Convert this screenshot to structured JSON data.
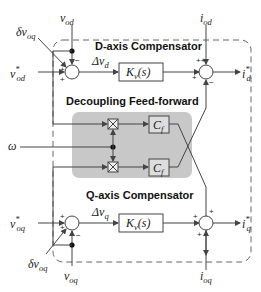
{
  "diagram": {
    "d_axis": {
      "title": "D-axis Compensator",
      "block": "K",
      "block_sub": "v",
      "block_arg": "(s)",
      "error": "Δv",
      "error_sub": "d",
      "ref_input": "v",
      "ref_input_sub": "od",
      "ref_input_sup": "*",
      "feedback": "v",
      "feedback_sub": "od",
      "cross_input": "δv",
      "cross_input_sub": "oq",
      "current_ff": "i",
      "current_ff_sub": "od",
      "output": "i",
      "output_sub": "d",
      "output_sup": "*",
      "signs": {
        "sum1_top": "−",
        "sum1_left1": "+",
        "sum1_left2": "+",
        "sum2_top": "++",
        "sum2_left": "+",
        "sum2_bottom": "−"
      }
    },
    "feedforward": {
      "title": "Decoupling Feed-forward",
      "block_top": "C",
      "block_top_sub": "f",
      "block_bottom": "C",
      "block_bottom_sub": "f",
      "freq_input": "ω"
    },
    "q_axis": {
      "title": "Q-axis Compensator",
      "block": "K",
      "block_sub": "v",
      "block_arg": "(s)",
      "error": "Δv",
      "error_sub": "q",
      "ref_input": "v",
      "ref_input_sub": "oq",
      "ref_input_sup": "*",
      "feedback": "v",
      "feedback_sub": "oq",
      "cross_input": "δv",
      "cross_input_sub": "oq",
      "current_ff": "i",
      "current_ff_sub": "oq",
      "output": "i",
      "output_sub": "q",
      "output_sup": "*",
      "signs": {
        "sum1_left1": "+",
        "sum1_left2": "+",
        "sum1_bottom": "−",
        "sum2_top": "+",
        "sum2_left": "+",
        "sum2_bottom": "+"
      }
    },
    "colors": {
      "feedforward_bg": "#c8c8c8",
      "line": "#444444",
      "dashed_border": "#666666"
    }
  }
}
